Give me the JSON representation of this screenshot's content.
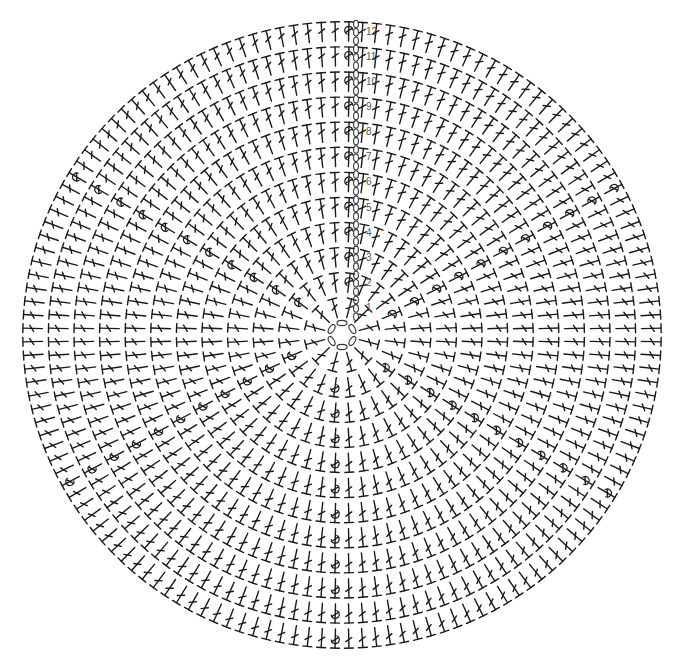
{
  "diagram": {
    "title": "",
    "type": "crochet-round-chart",
    "rounds": 12,
    "round_labels": [
      "1",
      "2",
      "3",
      "4",
      "5",
      "6",
      "7",
      "8",
      "9",
      "10",
      "11",
      "12"
    ],
    "center_ring_chains": 6,
    "stitch_symbol": "double-crochet",
    "increase_symbol": "increase-loop",
    "start_chain_symbol": "chain",
    "stitches_per_round_base": 12,
    "increase_wedges": 6,
    "colors": {
      "ink": "#1a1a1a",
      "label": "#555555",
      "background": "#ffffff"
    }
  }
}
